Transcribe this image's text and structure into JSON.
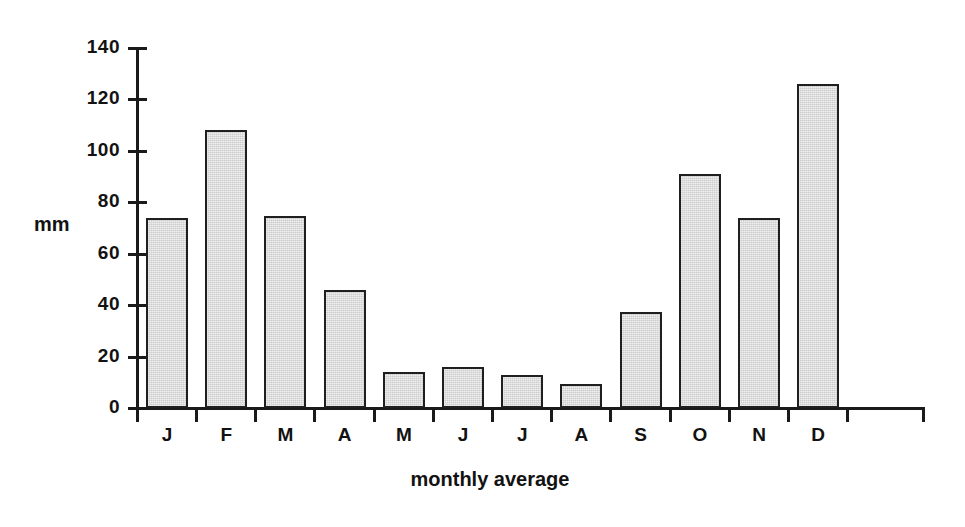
{
  "chart_data": {
    "type": "bar",
    "title": "",
    "categories": [
      "J",
      "F",
      "M",
      "A",
      "M",
      "J",
      "J",
      "A",
      "S",
      "O",
      "N",
      "D"
    ],
    "values": [
      74,
      108,
      74.5,
      46,
      14,
      16,
      13,
      9.5,
      37.5,
      91,
      74,
      126
    ],
    "xlabel": "monthly average",
    "ylabel": "mm",
    "ylim": [
      0,
      140
    ],
    "ytick_labels": [
      "140",
      "120",
      "100",
      "80",
      "60",
      "40",
      "20",
      "0"
    ],
    "ytick_values": [
      140,
      120,
      100,
      80,
      60,
      40,
      20,
      0
    ],
    "grid": false,
    "legend": "none",
    "bar_fill_color": "#cccccc",
    "bar_edge_color": "#1f1f1f",
    "axis_color": "#1a1a1a",
    "background_color": "#ffffff"
  }
}
